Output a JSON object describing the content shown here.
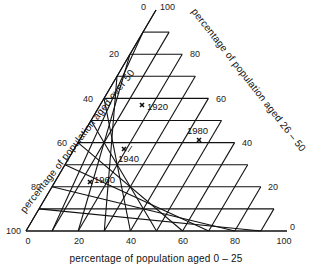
{
  "axes": {
    "left_title": "percentage of population aged over 50",
    "right_title": "percentage of population aged 26 – 50",
    "bottom_title": "percentage of population aged 0 – 25",
    "left_ticks": [
      "0",
      "20",
      "40",
      "60",
      "80",
      "100"
    ],
    "right_ticks": [
      "100",
      "80",
      "60",
      "40",
      "20",
      "0"
    ],
    "bottom_ticks": [
      "0",
      "20",
      "40",
      "60",
      "80",
      "100"
    ]
  },
  "points": [
    {
      "label": "1920"
    },
    {
      "label": "1940"
    },
    {
      "label": "1960"
    },
    {
      "label": "1980"
    }
  ],
  "chart_data": {
    "type": "ternary",
    "title": "",
    "axes": {
      "bottom": "percentage of population aged 0 – 25",
      "right": "percentage of population aged 26 – 50",
      "left": "percentage of population aged over 50"
    },
    "grid_step": 10,
    "tick_labels": [
      0,
      20,
      40,
      60,
      80,
      100
    ],
    "series": [
      {
        "name": "1920",
        "aged_0_25": 16,
        "aged_26_50": 57,
        "aged_over_50": 27
      },
      {
        "name": "1940",
        "aged_0_25": 19,
        "aged_26_50": 37,
        "aged_over_50": 44
      },
      {
        "name": "1960",
        "aged_0_25": 14,
        "aged_26_50": 22,
        "aged_over_50": 64
      },
      {
        "name": "1980",
        "aged_0_25": 46,
        "aged_26_50": 41,
        "aged_over_50": 13
      }
    ],
    "grid": true,
    "legend": "none"
  }
}
